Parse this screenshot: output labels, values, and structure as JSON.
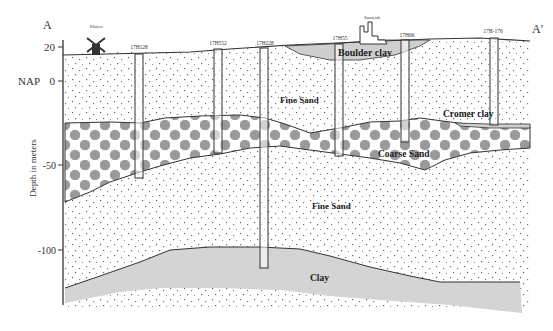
{
  "section": {
    "start_marker": "A",
    "end_marker": "A'",
    "datum_label": "NAP",
    "axis_label": "Depth in meters",
    "ticks": [
      {
        "value": "20",
        "y": 47
      },
      {
        "value": "0",
        "y": 81
      },
      {
        "value": "-50",
        "y": 165
      },
      {
        "value": "-100",
        "y": 250
      }
    ]
  },
  "landmarks": [
    {
      "name": "Sloten",
      "label": "Sloten",
      "type": "windmill"
    },
    {
      "name": "Sassenheim",
      "label": "Sassenh",
      "type": "town"
    }
  ],
  "boreholes": [
    {
      "id": "17H128",
      "label": "17H128"
    },
    {
      "id": "17H552",
      "label": "17H552"
    },
    {
      "id": "17H228",
      "label": "17H228"
    },
    {
      "id": "17H55",
      "label": "17H55"
    },
    {
      "id": "17H66",
      "label": "17H66"
    },
    {
      "id": "17H-176",
      "label": "17H-176"
    }
  ],
  "layers": {
    "boulder_clay": "Boulder clay",
    "fine_sand_upper": "Fine Sand",
    "cromer_clay": "Cromer clay",
    "coarse_sand": "Coarse Sand",
    "fine_sand_lower": "Fine Sand",
    "clay": "Clay"
  },
  "colors": {
    "line": "#333333",
    "clay_fill": "#d4d4d4",
    "boulder_fill": "#cfcfcf",
    "gravel_dot": "#9a9a9a",
    "sand_dot": "#555555"
  }
}
